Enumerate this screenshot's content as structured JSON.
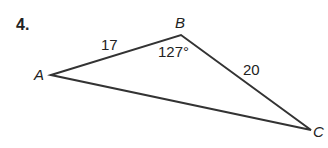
{
  "problem": {
    "number": "4.",
    "vertices": {
      "A": "A",
      "B": "B",
      "C": "C"
    },
    "sides": {
      "AB": "17",
      "BC": "20"
    },
    "angle_B": "127°"
  }
}
